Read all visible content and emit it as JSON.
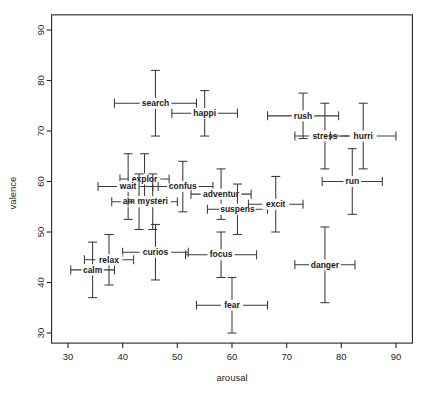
{
  "chart_data": {
    "type": "scatter",
    "title": "",
    "xlabel": "arousal",
    "ylabel": "valence",
    "xlim": [
      27,
      93
    ],
    "ylim": [
      28,
      93
    ],
    "xticks": [
      30,
      40,
      50,
      60,
      70,
      80,
      90
    ],
    "yticks": [
      30,
      40,
      50,
      60,
      70,
      80,
      90
    ],
    "grid": false,
    "legend": "none",
    "error_bars": "both",
    "points": [
      {
        "label": "search",
        "x": 46.0,
        "y": 75.5,
        "xerr": 7.5,
        "yerr": 6.5
      },
      {
        "label": "happi",
        "x": 55.0,
        "y": 73.5,
        "xerr": 6.0,
        "yerr": 4.5
      },
      {
        "label": "rush",
        "x": 73.0,
        "y": 73.0,
        "xerr": 6.5,
        "yerr": 4.5
      },
      {
        "label": "stress",
        "x": 77.0,
        "y": 69.0,
        "xerr": 5.5,
        "yerr": 6.5
      },
      {
        "label": "hurri",
        "x": 84.0,
        "y": 69.0,
        "xerr": 6.0,
        "yerr": 6.5
      },
      {
        "label": "confus",
        "x": 51.0,
        "y": 59.0,
        "xerr": 5.5,
        "yerr": 5.0
      },
      {
        "label": "explor",
        "x": 44.0,
        "y": 60.5,
        "xerr": 4.5,
        "yerr": 5.0
      },
      {
        "label": "wait",
        "x": 41.0,
        "y": 59.0,
        "xerr": 5.5,
        "yerr": 6.5
      },
      {
        "label": "adventur",
        "x": 58.0,
        "y": 57.5,
        "xerr": 5.5,
        "yerr": 5.0
      },
      {
        "label": "run",
        "x": 82.0,
        "y": 60.0,
        "xerr": 5.5,
        "yerr": 6.5
      },
      {
        "label": "ambient",
        "x": 43.0,
        "y": 56.0,
        "xerr": 5.0,
        "yerr": 5.5
      },
      {
        "label": "mysteri",
        "x": 45.5,
        "y": 56.0,
        "xerr": 4.5,
        "yerr": 5.5
      },
      {
        "label": "suspens",
        "x": 61.0,
        "y": 54.5,
        "xerr": 5.5,
        "yerr": 5.0
      },
      {
        "label": "excit",
        "x": 68.0,
        "y": 55.5,
        "xerr": 5.0,
        "yerr": 5.5
      },
      {
        "label": "curios",
        "x": 46.0,
        "y": 46.0,
        "xerr": 6.0,
        "yerr": 5.5
      },
      {
        "label": "focus",
        "x": 58.0,
        "y": 45.5,
        "xerr": 6.5,
        "yerr": 4.5
      },
      {
        "label": "relax",
        "x": 37.5,
        "y": 44.5,
        "xerr": 4.5,
        "yerr": 5.0
      },
      {
        "label": "calm",
        "x": 34.5,
        "y": 42.5,
        "xerr": 4.0,
        "yerr": 5.5
      },
      {
        "label": "danger",
        "x": 77.0,
        "y": 43.5,
        "xerr": 5.5,
        "yerr": 7.5
      },
      {
        "label": "fear",
        "x": 60.0,
        "y": 35.5,
        "xerr": 6.5,
        "yerr": 5.5
      }
    ]
  }
}
